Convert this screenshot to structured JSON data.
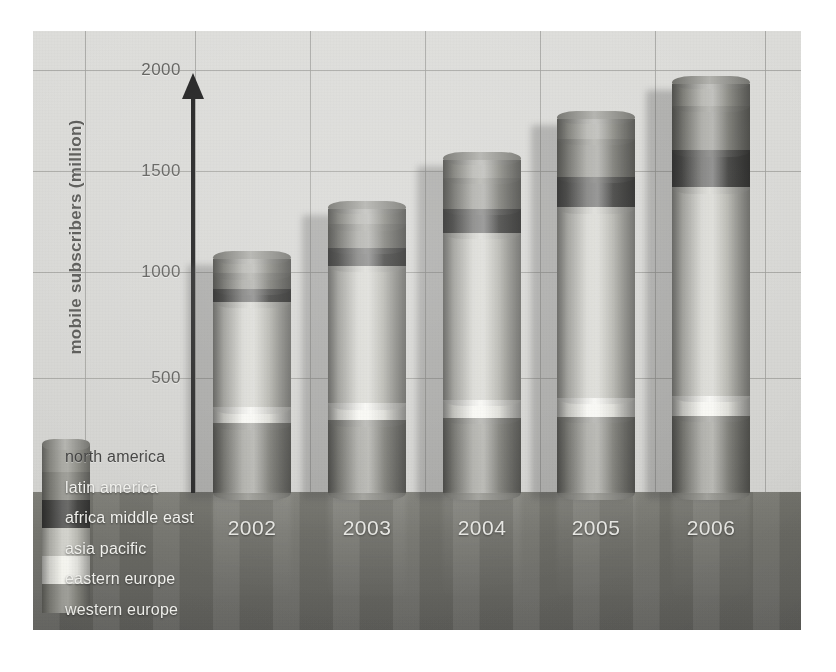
{
  "chart_data": {
    "type": "bar",
    "subtype": "stacked-cylinder-3d",
    "title": "",
    "xlabel": "",
    "ylabel": "mobile subscribers (million)",
    "ylim": [
      0,
      2000
    ],
    "yticks": [
      500,
      1000,
      1500,
      2000
    ],
    "ytick_labels": [
      "500",
      "1000",
      "1500",
      "2000"
    ],
    "grid": true,
    "legend_position": "bottom-left",
    "categories": [
      "2002",
      "2003",
      "2004",
      "2005",
      "2006"
    ],
    "series": [
      {
        "name": "western europe",
        "color": "#8d8d86",
        "values": [
          330,
          345,
          355,
          360,
          365
        ]
      },
      {
        "name": "eastern europe",
        "color": "#f4f4ee",
        "values": [
          75,
          80,
          85,
          90,
          95
        ]
      },
      {
        "name": "asia pacific",
        "color": "#c9c9c2",
        "values": [
          500,
          650,
          790,
          900,
          985
        ]
      },
      {
        "name": "africa middle east",
        "color": "#4a4a48",
        "values": [
          60,
          85,
          115,
          145,
          175
        ]
      },
      {
        "name": "latin america",
        "color": "#8a8a83",
        "values": [
          75,
          110,
          145,
          180,
          210
        ]
      },
      {
        "name": "north america",
        "color": "#9a9a93",
        "values": [
          65,
          75,
          85,
          95,
          105
        ]
      }
    ],
    "totals": [
      1105,
      1345,
      1575,
      1770,
      1935
    ]
  },
  "axis": {
    "y_title": "mobile subscribers (million)",
    "arrow_icon": "up-arrow-axis-icon"
  },
  "legend": {
    "title": "",
    "swatch_icon": "legend-cylinder-icon",
    "items": [
      {
        "label": "north america",
        "color": "#9a9a93",
        "text_tone": "dark"
      },
      {
        "label": "latin america",
        "color": "#8a8a83",
        "text_tone": "light"
      },
      {
        "label": "africa middle east",
        "color": "#4a4a48",
        "text_tone": "light"
      },
      {
        "label": "asia pacific",
        "color": "#c9c9c2",
        "text_tone": "light"
      },
      {
        "label": "eastern europe",
        "color": "#f4f4ee",
        "text_tone": "light"
      },
      {
        "label": "western europe",
        "color": "#8d8d86",
        "text_tone": "light"
      }
    ]
  },
  "palette": {
    "background": "#ffffff",
    "wall": "#d9d9d6",
    "floor": "#6b6b66",
    "grid": "#9b9b97",
    "axis": "#1b1b1b",
    "tick_text": "#5d5d5a",
    "category_text": "#e6e6e2"
  }
}
